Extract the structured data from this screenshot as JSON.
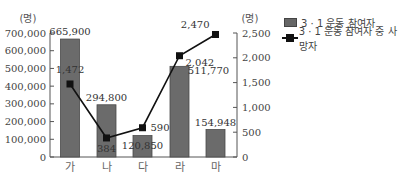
{
  "chart_data": {
    "type": "bar+line",
    "title": "",
    "categories": [
      "가",
      "나",
      "다",
      "라",
      "마"
    ],
    "series": [
      {
        "name": "3 · 1 운동 참여자",
        "type": "bar",
        "axis": "left",
        "values": [
          665900,
          294800,
          120850,
          511770,
          154948
        ],
        "labels": [
          "665,900",
          "294,800",
          "120,850",
          "511,770",
          "154,948"
        ],
        "color": "#6b6b6b"
      },
      {
        "name": "3 · 1 운동 참여자 중 사망자",
        "type": "line",
        "axis": "right",
        "values": [
          1472,
          384,
          590,
          2042,
          2470
        ],
        "labels": [
          "1,472",
          "384",
          "590",
          "2,042",
          "2,470"
        ],
        "color": "#111111"
      }
    ],
    "left_axis": {
      "unit": "(명)",
      "ylim": [
        0,
        700000
      ],
      "ticks": [
        "0",
        "100,000",
        "200,000",
        "300,000",
        "400,000",
        "500,000",
        "600,000",
        "700,000"
      ]
    },
    "right_axis": {
      "unit": "(명)",
      "ylim": [
        0,
        2500
      ],
      "ticks": [
        "0",
        "500",
        "1,000",
        "1,500",
        "2,000",
        "2,500"
      ]
    },
    "xlabel": "",
    "grid": false,
    "legend_position": "right"
  },
  "legend": {
    "bar_label": "3 · 1 운동 참여자",
    "line_label": "3 · 1 운동 참여자 중 사망자"
  }
}
